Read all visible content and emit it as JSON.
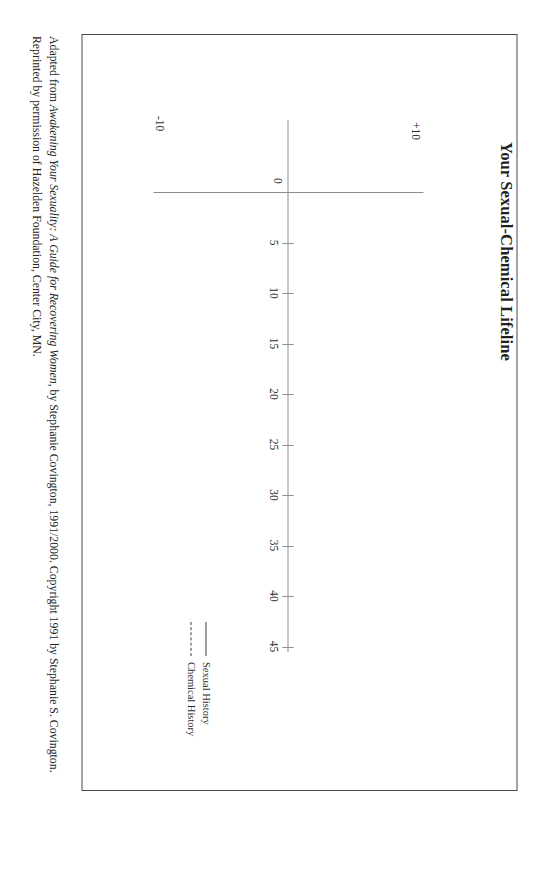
{
  "document": {
    "title": "Your Sexual-Chemical Lifeline"
  },
  "chart_data": {
    "type": "line",
    "title": "Your Sexual-Chemical Lifeline",
    "xlabel": "",
    "ylabel": "",
    "x_ticks": [
      5,
      10,
      15,
      20,
      25,
      30,
      35,
      40,
      45
    ],
    "x_tick_labels": [
      "5",
      "10",
      "15",
      "20",
      "25",
      "30",
      "35",
      "40",
      "45"
    ],
    "xlim": [
      0,
      47
    ],
    "y_tick_labels": [
      "+10",
      "0",
      "-10"
    ],
    "ylim": [
      -10,
      10
    ],
    "grid": false,
    "legend_position": "right",
    "series": [
      {
        "name": "Sexual History",
        "style": "solid",
        "x": [],
        "values": []
      },
      {
        "name": "Chemical History",
        "style": "dashed",
        "x": [],
        "values": []
      }
    ]
  },
  "axis": {
    "y_top": "+10",
    "y_zero": "0",
    "y_bottom": "-10"
  },
  "legend": {
    "items": [
      {
        "label": "Sexual History",
        "style": "solid"
      },
      {
        "label": "Chemical History",
        "style": "dashed"
      }
    ]
  },
  "citation": {
    "line1_a": "Adapted from ",
    "line1_italic": "Awakening Your Sexuality: A Guide for Recovering Women",
    "line1_b": ", by Stephanie Covington, 1991/2000. Copyright 1991 by Stephanie S. Covington.",
    "line2": "Reprinted by permission of Hazelden Foundation, Center City, MN."
  },
  "colors": {
    "ink": "#2b2b2b",
    "axis": "#8e8e8e",
    "frame": "#4a4a4a",
    "paper": "#ffffff"
  }
}
